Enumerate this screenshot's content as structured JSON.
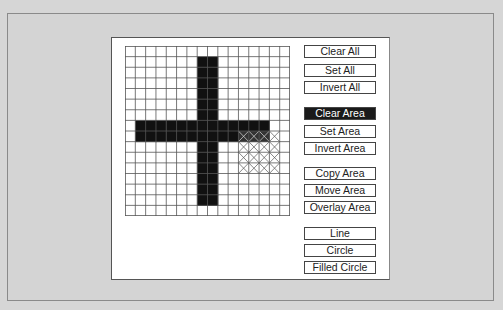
{
  "canvas": {
    "columns": 16,
    "rows": 16,
    "filled_cells_description": "Black plus shape: horizontal bar rows 7-8 cols 1-13; vertical bar cols 7-8 rows 1-14",
    "horizontal_bar": {
      "row_start": 7,
      "row_end": 8,
      "col_start": 1,
      "col_end": 13
    },
    "vertical_bar": {
      "col_start": 7,
      "col_end": 8,
      "row_start": 1,
      "row_end": 14
    },
    "selected_area": {
      "col_start": 11,
      "col_end": 14,
      "row_start": 8,
      "row_end": 11
    },
    "fill_color": "#111111",
    "grid_line_color": "#555555"
  },
  "buttons": {
    "clear_all": "Clear All",
    "set_all": "Set All",
    "invert_all": "Invert All",
    "clear_area": "Clear Area",
    "set_area": "Set Area",
    "invert_area": "Invert Area",
    "copy_area": "Copy Area",
    "move_area": "Move Area",
    "overlay_area": "Overlay Area",
    "line": "Line",
    "circle": "Circle",
    "filled_circle": "Filled Circle"
  },
  "active_button": "clear_area"
}
